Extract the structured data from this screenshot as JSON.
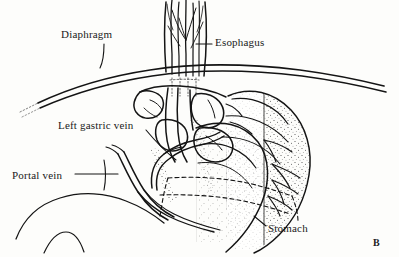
{
  "figure": {
    "panel_letter": "B",
    "style": "black ink line drawing with stipple shading on white background",
    "background_color": "#fdfdfb",
    "ink_color": "#141414",
    "width": 399,
    "height": 257
  },
  "labels": [
    {
      "id": "diaphragm",
      "text": "Diaphragm",
      "x": 61,
      "y": 28,
      "leader": "short diagonal line down-right to the diaphragm curve"
    },
    {
      "id": "esophagus",
      "text": "Esophagus",
      "x": 215,
      "y": 36,
      "leader": "short horizontal line left to the esophageal muscle fibers"
    },
    {
      "id": "left_gastric_vein",
      "text": "Left gastric vein",
      "x": 58,
      "y": 119,
      "leader": "long diagonal line down-right to the gastric vein arch"
    },
    {
      "id": "portal_vein",
      "text": "Portal vein",
      "x": 12,
      "y": 169,
      "leader": "horizontal line right to the portal vein trunk"
    },
    {
      "id": "stomach",
      "text": "Stomach",
      "x": 268,
      "y": 222,
      "leader": "short diagonal line up-left to the greater curvature"
    }
  ],
  "structures": [
    {
      "name": "diaphragm",
      "description": "Broad double-line arc sweeping from lower left up to the right, crossing behind the esophagus"
    },
    {
      "name": "esophagus",
      "description": "Vertical tube at top center with longitudinal muscle fiber striations, entering the hiatus"
    },
    {
      "name": "esophageal-venous-plexus",
      "description": "Network of tortuous submucosal veins at the gastroesophageal junction"
    },
    {
      "name": "left-gastric-vein",
      "description": "Vein arching from the portal trunk up along the lesser curvature to the cardia"
    },
    {
      "name": "portal-vein",
      "description": "Large vein trunk running diagonally at lower left of the junction"
    },
    {
      "name": "stomach-fundus",
      "description": "Rounded organ body at right with stipple shading along its curvature"
    },
    {
      "name": "gastric-dashed-outline",
      "description": "Two horizontal dashed contour lines crossing the stomach body"
    }
  ]
}
